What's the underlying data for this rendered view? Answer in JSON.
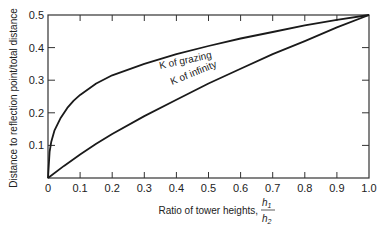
{
  "chart_data": {
    "type": "line",
    "title": "",
    "xlabel": "Ratio of tower heights, h1/h2",
    "xlabel_text": "Ratio of tower heights,",
    "xlabel_fraction": {
      "numerator": "h",
      "numerator_sub": "1",
      "denominator": "h",
      "denominator_sub": "2"
    },
    "ylabel": "Distance to reflection point/total distance",
    "xlim": [
      0,
      1.0
    ],
    "ylim": [
      0,
      0.5
    ],
    "x_ticks": [
      "0",
      "0.1",
      "0.2",
      "0.3",
      "0.4",
      "0.5",
      "0.6",
      "0.7",
      "0.8",
      "0.9",
      "1.0"
    ],
    "y_ticks": [
      "0.1",
      "0.2",
      "0.3",
      "0.4",
      "0.5"
    ],
    "grid": false,
    "legend": "none (inline curve labels)",
    "series": [
      {
        "name": "K of grazing",
        "label": "K of grazing",
        "x": [
          0,
          0.005,
          0.01,
          0.02,
          0.04,
          0.06,
          0.08,
          0.1,
          0.15,
          0.2,
          0.3,
          0.4,
          0.5,
          0.6,
          0.7,
          0.8,
          0.9,
          1.0
        ],
        "values": [
          0,
          0.08,
          0.11,
          0.145,
          0.185,
          0.215,
          0.237,
          0.255,
          0.29,
          0.315,
          0.35,
          0.38,
          0.405,
          0.428,
          0.448,
          0.468,
          0.485,
          0.5
        ]
      },
      {
        "name": "K of infinity",
        "label": "K of infinity",
        "x": [
          0,
          0.05,
          0.1,
          0.15,
          0.2,
          0.3,
          0.4,
          0.5,
          0.6,
          0.7,
          0.8,
          0.9,
          1.0
        ],
        "values": [
          0,
          0.037,
          0.072,
          0.105,
          0.135,
          0.19,
          0.24,
          0.29,
          0.335,
          0.38,
          0.42,
          0.462,
          0.5
        ]
      }
    ]
  },
  "labels": {
    "series_0": "K of grazing",
    "series_1": "K of infinity",
    "xlabel_text": "Ratio of tower heights,",
    "ylabel": "Distance to reflection point/total distance",
    "h": "h",
    "sub1": "1",
    "sub2": "2"
  },
  "colors": {
    "line": "#1a1a1a",
    "axis": "#333333",
    "background": "#ffffff"
  }
}
